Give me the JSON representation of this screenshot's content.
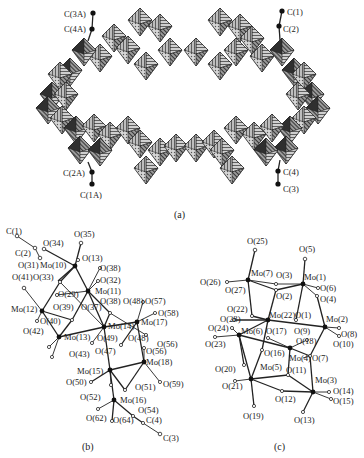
{
  "figure": {
    "panels": [
      {
        "id": "a",
        "caption": "(a)",
        "description": "Polyhedral representation of ring-shaped polyoxomolybdate with ethyl groups",
        "labels": [
          "C(3A)",
          "C(4A)",
          "C(1)",
          "C(2)",
          "C(2A)",
          "C(1A)",
          "C(4)",
          "C(3)"
        ]
      },
      {
        "id": "b",
        "caption": "(b)",
        "labels": {
          "carbon": [
            "C(1)",
            "C(2)",
            "C(3)",
            "C(4)"
          ],
          "molybdenum": [
            "Mo(10)",
            "Mo(11)",
            "Mo(12)",
            "Mo(13)",
            "Mo(14)",
            "Mo(15)",
            "Mo(16)",
            "Mo(17)",
            "Mo(18)"
          ],
          "oxygen": [
            "O(34)",
            "O(35)",
            "O(31)",
            "O(13)",
            "O(38)",
            "O(32)",
            "O(41)",
            "O(33)",
            "O(29)",
            "O(39)",
            "O(37)",
            "O(38)",
            "O(48)",
            "O(57)",
            "O(58)",
            "O(40)",
            "O(42)",
            "O(49)",
            "O(48)",
            "O(56)",
            "O(56)",
            "O(43)",
            "O(47)",
            "O(50)",
            "O(51)",
            "O(59)",
            "O(52)",
            "O(62)",
            "O(64)",
            "O(54)"
          ]
        }
      },
      {
        "id": "c",
        "caption": "(c)",
        "labels": {
          "molybdenum": [
            "Mo(7)",
            "Mo(1)",
            "Mo(22)",
            "Mo(2)",
            "Mo(6)",
            "Mo(4)",
            "Mo(5)",
            "Mo(3)"
          ],
          "oxygen": [
            "O(25)",
            "O(5)",
            "O(26)",
            "O(3)",
            "O(6)",
            "O(27)",
            "O(2)",
            "O(4)",
            "O(22)",
            "O(1)",
            "O(28)",
            "O(24)",
            "O(17)",
            "O(9)",
            "O(8)",
            "O(23)",
            "O(18)",
            "O(10)",
            "O(16)",
            "O(7)",
            "O(11)",
            "O(20)",
            "O(21)",
            "O(14)",
            "O(12)",
            "O(15)",
            "O(19)",
            "O(13)"
          ]
        }
      }
    ]
  },
  "a": {
    "c3a": "C(3A)",
    "c4a": "C(4A)",
    "c1": "C(1)",
    "c2": "C(2)",
    "c2a": "C(2A)",
    "c1a": "C(1A)",
    "c4": "C(4)",
    "c3": "C(3)",
    "caption": "(a)"
  },
  "b": {
    "caption": "(b)",
    "C1": "C(1)",
    "C2": "C(2)",
    "C3": "C(3)",
    "C4": "C(4)",
    "Mo10": "Mo(10)",
    "Mo11": "Mo(11)",
    "Mo12": "Mo(12)",
    "Mo13": "Mo(13)",
    "Mo14": "Mo(14)",
    "Mo15": "Mo(15)",
    "Mo16": "Mo(16)",
    "Mo17": "Mo(17)",
    "Mo18": "Mo(18)",
    "O34": "O(34)",
    "O35": "O(35)",
    "O31": "O(31)",
    "O13": "O(13)",
    "O38a": "O(38)",
    "O32": "O(32)",
    "O41": "O(41)",
    "O33": "O(33)",
    "O29": "O(29)",
    "O39": "O(39)",
    "O37": "O(37)",
    "O38b": "O(38)",
    "O48a": "O(48)",
    "O57": "O(57)",
    "O58": "O(58)",
    "O40": "O(40)",
    "O42": "O(42)",
    "O49": "O(49)",
    "O48b": "O(48)",
    "O56a": "O(56)",
    "O56b": "O(56)",
    "O43": "O(43)",
    "O47": "O(47)",
    "O50": "O(50)",
    "O51": "O(51)",
    "O59": "O(59)",
    "O52": "O(52)",
    "O62": "O(62)",
    "O64": "O(64)",
    "O54": "O(54)"
  },
  "c": {
    "caption": "(c)",
    "Mo7": "Mo(7)",
    "Mo1": "Mo(1)",
    "Mo22": "Mo(22)",
    "Mo2": "Mo(2)",
    "Mo6": "Mo(6)",
    "Mo4": "Mo(4)",
    "Mo5": "Mo(5)",
    "Mo3": "Mo(3)",
    "O25": "O(25)",
    "O5": "O(5)",
    "O26": "O(26)",
    "O3": "O(3)",
    "O6": "O(6)",
    "O27": "O(27)",
    "O2": "O(2)",
    "O4": "O(4)",
    "O22": "O(22)",
    "O1": "O(1)",
    "O28": "O(28)",
    "O24": "O(24)",
    "O17": "O(17)",
    "O9": "O(9)",
    "O8": "O(8)",
    "O23": "O(23)",
    "O18": "O(18)",
    "O10": "O(10)",
    "O16": "O(16)",
    "O7": "O(7)",
    "O11": "O(11)",
    "O20": "O(20)",
    "O21": "O(21)",
    "O14": "O(14)",
    "O12": "O(12)",
    "O15": "O(15)",
    "O19": "O(19)",
    "O13": "O(13)"
  },
  "colors": {
    "ink": "#222222",
    "poly_light": "#b8b8b8",
    "poly_mid": "#8a8a8a",
    "poly_dark": "#3a3a3a",
    "background": "#ffffff"
  }
}
